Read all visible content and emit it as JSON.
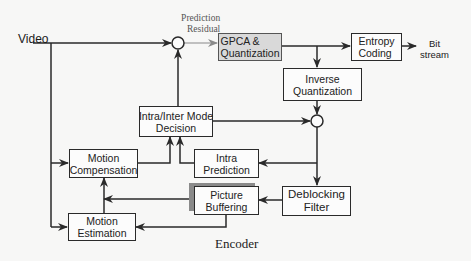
{
  "diagram": {
    "caption": "Encoder",
    "input_label": "Video",
    "residual_label_line1": "Prediction",
    "residual_label_line2": "Residual",
    "output_label_line1": "Bit",
    "output_label_line2": "stream",
    "blocks": {
      "gpca": {
        "line1": "GPCA &",
        "line2": "Quantization"
      },
      "entropy": {
        "line1": "Entropy",
        "line2": "Coding"
      },
      "inverse_quant": {
        "line1": "Inverse",
        "line2": "Quantization"
      },
      "mode_decision": {
        "line1": "Intra/Inter Mode",
        "line2": "Decision"
      },
      "motion_comp": {
        "line1": "Motion",
        "line2": "Compensation"
      },
      "intra_pred": {
        "line1": "Intra",
        "line2": "Prediction"
      },
      "deblocking": {
        "line1": "Deblocking",
        "line2": "Filter"
      },
      "picture_buf": {
        "line1": "Picture",
        "line2": "Buffering"
      },
      "motion_est": {
        "line1": "Motion",
        "line2": "Estimation"
      }
    },
    "colors": {
      "line": "#2a2a2a",
      "gpca_fill": "#d9d9d9",
      "residual_arrow": "#8a8a8a"
    }
  }
}
